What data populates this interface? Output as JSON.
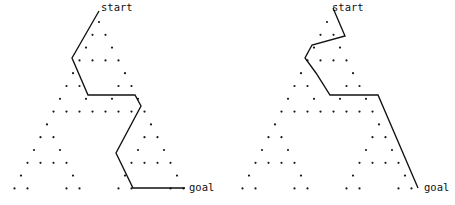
{
  "figure": {
    "type": "diagram",
    "background_color": "#ffffff",
    "dot_color": "#1a1a1a",
    "line_color": "#111111",
    "panel_count": 2
  },
  "lattice": {
    "rows": 14,
    "apex_x": 99,
    "apex_y": 22,
    "row_spacing": 12.8,
    "col_spacing": 13.0,
    "dot_radius": 1.1,
    "rule": "pascal-triangle-mod-2"
  },
  "panels": [
    {
      "id": "left",
      "name": "left-panel",
      "start_label": "start",
      "goal_label": "goal",
      "start_label_x": 101,
      "start_label_y": 2,
      "goal_label_x": 189,
      "goal_label_y": 182,
      "route": [
        [
          99,
          11
        ],
        [
          72,
          58
        ],
        [
          88,
          95
        ],
        [
          135,
          95
        ],
        [
          141,
          106
        ],
        [
          116,
          153
        ],
        [
          133,
          188
        ],
        [
          185,
          188
        ]
      ]
    },
    {
      "id": "right",
      "name": "right-panel",
      "start_label": "start",
      "goal_label": "goal",
      "start_label_x": 104,
      "start_label_y": 2,
      "goal_label_x": 196,
      "goal_label_y": 182,
      "route": [
        [
          105,
          8
        ],
        [
          117,
          36
        ],
        [
          84,
          45
        ],
        [
          77,
          58
        ],
        [
          88,
          73
        ],
        [
          102,
          95
        ],
        [
          150,
          95
        ],
        [
          190,
          188
        ]
      ]
    }
  ]
}
